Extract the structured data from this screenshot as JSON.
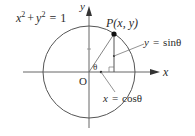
{
  "diagram": {
    "type": "unit-circle",
    "equation": {
      "lhs_x": "x",
      "exp_x": "2",
      "plus": "+",
      "lhs_y": "y",
      "exp_y": "2",
      "equals": "=",
      "rhs": "1"
    },
    "axes": {
      "x_label": "x",
      "y_label": "y",
      "origin_label": "O"
    },
    "point": {
      "name": "P",
      "coords": "(x, y)"
    },
    "angle_label": "θ",
    "sin_label": {
      "var": "y",
      "equals": "=",
      "expr": "sinθ"
    },
    "cos_label": {
      "var": "x",
      "equals": "=",
      "expr": "cosθ"
    },
    "colors": {
      "stroke": "#555555",
      "text": "#2b2b2b",
      "point": "#111111"
    }
  }
}
